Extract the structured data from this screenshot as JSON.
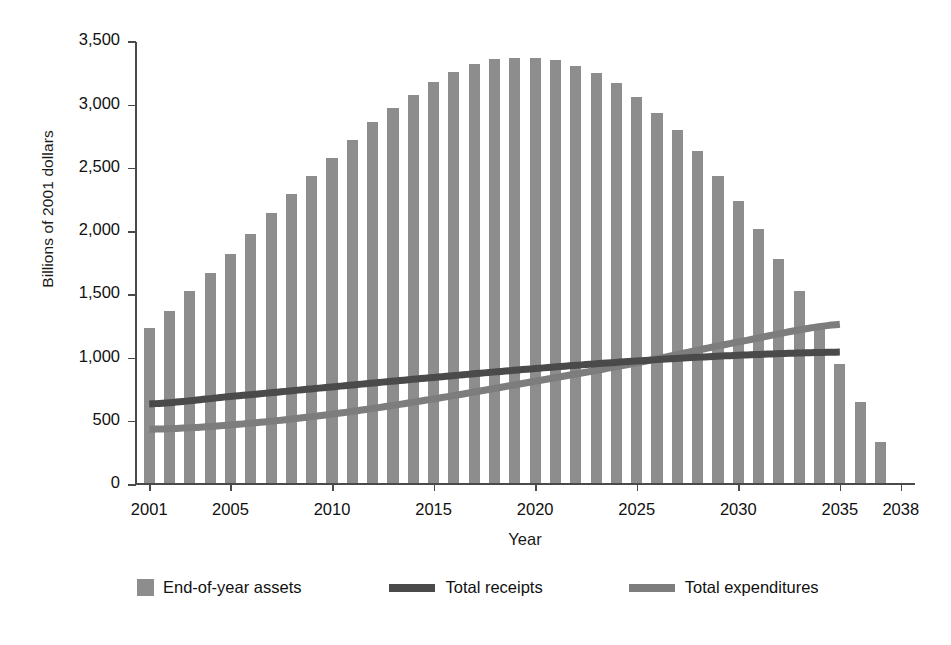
{
  "chart_data": {
    "type": "bar",
    "title": "",
    "xlabel": "Year",
    "ylabel": "Billions of 2001 dollars",
    "ylim": [
      0,
      3500
    ],
    "xlim": [
      2000.3,
      2038.7
    ],
    "yticks": [
      0,
      500,
      1000,
      1500,
      2000,
      2500,
      3000,
      3500
    ],
    "ytick_labels": [
      "0",
      "500",
      "1,000",
      "1,500",
      "2,000",
      "2,500",
      "3,000",
      "3,500"
    ],
    "xticks": [
      2001,
      2005,
      2010,
      2015,
      2020,
      2025,
      2030,
      2035,
      2038
    ],
    "xtick_labels": [
      "2001",
      "2005",
      "2010",
      "2015",
      "2020",
      "2025",
      "2030",
      "2035",
      "2038"
    ],
    "grid": false,
    "legend_position": "below",
    "colors": {
      "assets_bar": "#8d8d8d",
      "receipts_line": "#4a4a4a",
      "expenditures_line": "#7d7d7d",
      "axis": "#4a4a4a",
      "text": "#111111",
      "background": "#ffffff"
    },
    "categories": [
      2001,
      2002,
      2003,
      2004,
      2005,
      2006,
      2007,
      2008,
      2009,
      2010,
      2011,
      2012,
      2013,
      2014,
      2015,
      2016,
      2017,
      2018,
      2019,
      2020,
      2021,
      2022,
      2023,
      2024,
      2025,
      2026,
      2027,
      2028,
      2029,
      2030,
      2031,
      2032,
      2033,
      2034,
      2035,
      2036,
      2037
    ],
    "series": [
      {
        "name": "End-of-year assets",
        "type": "bar",
        "values": [
          1225,
          1360,
          1520,
          1665,
          1810,
          1970,
          2135,
          2290,
          2425,
          2575,
          2710,
          2855,
          2965,
          3070,
          3170,
          3250,
          3310,
          3350,
          3365,
          3360,
          3345,
          3300,
          3240,
          3160,
          3055,
          2930,
          2795,
          2630,
          2430,
          2230,
          2010,
          1775,
          1520,
          1245,
          945,
          640,
          330
        ]
      },
      {
        "name": "Total receipts",
        "type": "line",
        "x": [
          2001,
          2005,
          2010,
          2015,
          2020,
          2025,
          2030,
          2035
        ],
        "values": [
          640,
          700,
          775,
          850,
          920,
          980,
          1025,
          1050
        ]
      },
      {
        "name": "Total expenditures",
        "type": "line",
        "x": [
          2001,
          2005,
          2010,
          2015,
          2020,
          2025,
          2030,
          2035
        ],
        "values": [
          440,
          475,
          560,
          680,
          820,
          965,
          1130,
          1270
        ]
      }
    ],
    "legend_entries": [
      {
        "label": "End-of-year assets",
        "marker": "bar-swatch",
        "color": "#8d8d8d"
      },
      {
        "label": "Total receipts",
        "marker": "line-swatch",
        "color": "#4a4a4a"
      },
      {
        "label": "Total expenditures",
        "marker": "line-swatch",
        "color": "#7d7d7d"
      }
    ]
  }
}
